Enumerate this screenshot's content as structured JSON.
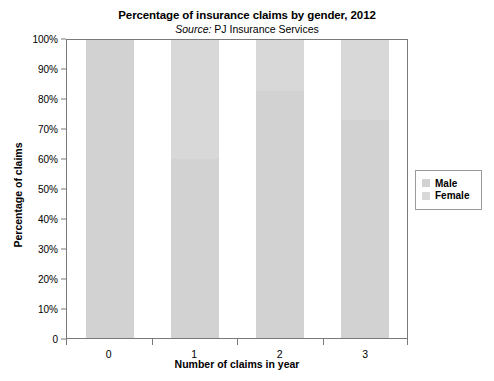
{
  "chart_data": {
    "type": "bar",
    "title": "Percentage of insurance claims by gender, 2012",
    "subtitle_prefix": "Source:",
    "subtitle_text": "PJ Insurance Services",
    "xlabel": "Number of claims in year",
    "ylabel": "Percentage of claims",
    "categories": [
      "0",
      "1",
      "2",
      "3"
    ],
    "series": [
      {
        "name": "Male",
        "values": [
          100,
          60,
          83,
          73
        ],
        "color": "#d2d2d2"
      },
      {
        "name": "Female",
        "values": [
          0,
          40,
          17,
          27
        ],
        "color": "#d8d8d8"
      }
    ],
    "stacked": true,
    "ylim": [
      0,
      100
    ],
    "ytick_labels": [
      "100%",
      "90%",
      "80%",
      "70%",
      "60%",
      "50%",
      "40%",
      "30%",
      "20%",
      "10%",
      "0"
    ],
    "ytick_values": [
      100,
      90,
      80,
      70,
      60,
      50,
      40,
      30,
      20,
      10,
      0
    ],
    "grid": false,
    "legend_position": "right",
    "legend_entries": [
      "Male",
      "Female"
    ],
    "axis_color": "#7a7a7a",
    "background": "#ffffff"
  }
}
